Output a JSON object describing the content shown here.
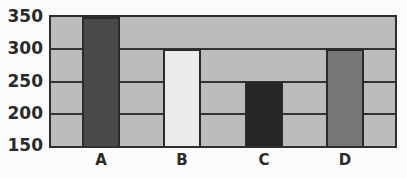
{
  "chart_data": {
    "type": "bar",
    "title": "",
    "xlabel": "",
    "ylabel": "",
    "categories": [
      "A",
      "B",
      "C",
      "D"
    ],
    "values": [
      350,
      300,
      250,
      300
    ],
    "bar_colors": [
      "#4a4a4a",
      "#ebebeb",
      "#262626",
      "#777777"
    ],
    "ylim": [
      150,
      350
    ],
    "yticks": [
      150,
      200,
      250,
      300,
      350
    ],
    "grid": true,
    "legend": null,
    "plot_background": "#bcbcbc"
  }
}
